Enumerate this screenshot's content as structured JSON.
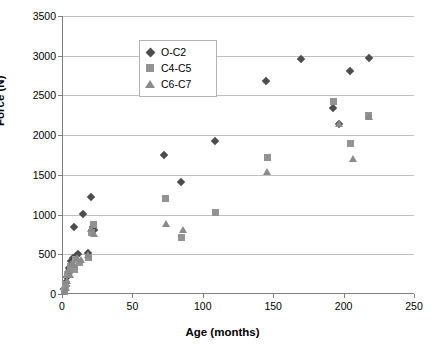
{
  "chart_data": {
    "type": "scatter",
    "title": "",
    "xlabel": "Age (months)",
    "ylabel": "Force (N)",
    "xlim": [
      0,
      250
    ],
    "ylim": [
      0,
      3500
    ],
    "xticks": [
      0,
      50,
      100,
      150,
      200,
      250
    ],
    "yticks": [
      0,
      500,
      1000,
      1500,
      2000,
      2500,
      3000,
      3500
    ],
    "grid": "horizontal",
    "legend_position": "top-left",
    "series": [
      {
        "name": "O-C2",
        "marker": "diamond",
        "color": "#4d4d4d",
        "points": [
          [
            1,
            60
          ],
          [
            2,
            95
          ],
          [
            2,
            150
          ],
          [
            3,
            210
          ],
          [
            4,
            330
          ],
          [
            5,
            300
          ],
          [
            6,
            420
          ],
          [
            7,
            455
          ],
          [
            8,
            840
          ],
          [
            9,
            480
          ],
          [
            11,
            500
          ],
          [
            14,
            1010
          ],
          [
            18,
            520
          ],
          [
            20,
            1215
          ],
          [
            21,
            840
          ],
          [
            22,
            800
          ],
          [
            72,
            1755
          ],
          [
            84,
            1415
          ],
          [
            108,
            1920
          ],
          [
            144,
            2680
          ],
          [
            169,
            2955
          ],
          [
            192,
            2345
          ],
          [
            196,
            2140
          ],
          [
            204,
            2810
          ],
          [
            217,
            2975
          ]
        ]
      },
      {
        "name": "C4-C5",
        "marker": "square",
        "color": "#939393",
        "points": [
          [
            1,
            40
          ],
          [
            2,
            120
          ],
          [
            3,
            240
          ],
          [
            4,
            255
          ],
          [
            5,
            350
          ],
          [
            6,
            345
          ],
          [
            8,
            310
          ],
          [
            9,
            430
          ],
          [
            12,
            400
          ],
          [
            18,
            455
          ],
          [
            20,
            775
          ],
          [
            22,
            870
          ],
          [
            73,
            1200
          ],
          [
            84,
            710
          ],
          [
            108,
            1020
          ],
          [
            145,
            1715
          ],
          [
            192,
            2425
          ],
          [
            204,
            1900
          ],
          [
            217,
            2245
          ]
        ]
      },
      {
        "name": "C6-C7",
        "marker": "triangle",
        "color": "#8a8a8a",
        "points": [
          [
            1,
            30
          ],
          [
            2,
            85
          ],
          [
            3,
            170
          ],
          [
            4,
            290
          ],
          [
            5,
            250
          ],
          [
            6,
            390
          ],
          [
            8,
            370
          ],
          [
            10,
            455
          ],
          [
            13,
            430
          ],
          [
            18,
            500
          ],
          [
            20,
            820
          ],
          [
            22,
            760
          ],
          [
            73,
            885
          ],
          [
            85,
            810
          ],
          [
            145,
            1545
          ],
          [
            196,
            2145
          ],
          [
            206,
            1705
          ],
          [
            217,
            2230
          ]
        ]
      }
    ]
  },
  "axes": {
    "ylabel": "Force (N)",
    "xlabel": "Age (months)",
    "ytick_labels": [
      "0",
      "500",
      "1000",
      "1500",
      "2000",
      "2500",
      "3000",
      "3500"
    ],
    "xtick_labels": [
      "0",
      "50",
      "100",
      "150",
      "200",
      "250"
    ]
  },
  "legend": {
    "items": [
      {
        "label": "O-C2",
        "marker": "diamond"
      },
      {
        "label": "C4-C5",
        "marker": "square"
      },
      {
        "label": "C6-C7",
        "marker": "triangle"
      }
    ]
  }
}
